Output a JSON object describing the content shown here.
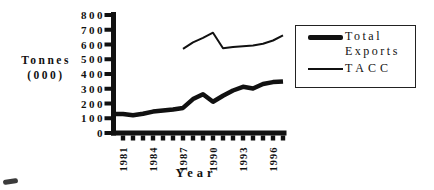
{
  "figure": {
    "y_axis_title_line1": "Tonnes",
    "y_axis_title_line2": "(000)",
    "x_axis_title": "Year"
  },
  "legend": {
    "position": "right",
    "items": [
      {
        "label": "Total Exports",
        "label_lines": [
          "Total",
          "Exports"
        ],
        "swatch": "thick-line"
      },
      {
        "label": "TACC",
        "label_lines": [
          "TACC"
        ],
        "swatch": "thin-line"
      }
    ]
  },
  "chart_data": {
    "type": "line",
    "title": "",
    "xlabel": "Year",
    "ylabel": "Tonnes (000)",
    "ylim": [
      0,
      800
    ],
    "yticks": [
      0,
      100,
      200,
      300,
      400,
      500,
      600,
      700,
      800
    ],
    "x_range": [
      1981,
      1997
    ],
    "x_tick_years": [
      1981,
      1982,
      1983,
      1984,
      1985,
      1986,
      1987,
      1988,
      1989,
      1990,
      1991,
      1992,
      1993,
      1994,
      1995,
      1996,
      1997
    ],
    "x_tick_label_years": [
      1981,
      1984,
      1987,
      1990,
      1993,
      1996
    ],
    "grid": false,
    "legend_position": "right",
    "colors": {
      "line": "#111111",
      "background": "#ffffff"
    },
    "series": [
      {
        "name": "Total Exports",
        "style": "thick",
        "stroke_width": 4.5,
        "start_year": 1981,
        "extend_to_axis": true,
        "values": [
          128,
          120,
          130,
          145,
          152,
          160,
          170,
          230,
          263,
          212,
          253,
          288,
          313,
          302,
          332,
          345,
          350
        ]
      },
      {
        "name": "TACC",
        "style": "thin",
        "stroke_width": 2,
        "start_year": 1987,
        "extend_to_axis": false,
        "values": [
          570,
          615,
          645,
          680,
          575,
          583,
          588,
          593,
          605,
          627,
          662
        ]
      }
    ]
  }
}
